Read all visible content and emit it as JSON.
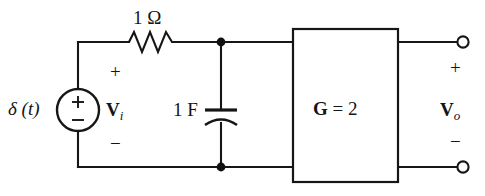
{
  "diagram": {
    "source": {
      "label": "δ (t)",
      "symbol_plus": "+",
      "symbol_minus": "−",
      "icon": "independent-voltage-source-icon"
    },
    "resistor": {
      "label": "1 Ω",
      "icon": "resistor-zigzag-icon"
    },
    "capacitor": {
      "label": "1 F",
      "icon": "capacitor-curved-plate-icon"
    },
    "gain_block": {
      "symbol": "G",
      "equals": " = ",
      "value": "2",
      "label": "G = 2",
      "icon": "amplifier-block-icon"
    },
    "input_port": {
      "label_v": "V",
      "label_sub": "i",
      "plus": "+",
      "minus": "−"
    },
    "output_port": {
      "label_v": "V",
      "label_sub": "o",
      "plus": "+",
      "minus": "−",
      "terminal_icon": "open-terminal-circle-icon"
    },
    "nodes": {
      "top_node_icon": "junction-dot-icon",
      "bottom_node_icon": "junction-dot-icon"
    },
    "colors": {
      "wire": "#161616",
      "background": "#ffffff",
      "text": "#141414"
    }
  }
}
